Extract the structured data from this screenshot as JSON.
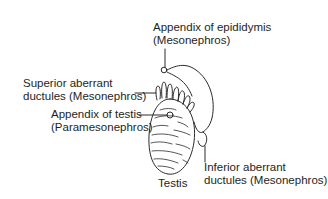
{
  "diagram": {
    "structure": "Testis",
    "labels": {
      "appendix_epididymis": {
        "line1": "Appendix of epididymis",
        "line2": "(Mesonephros)"
      },
      "superior_aberrant": {
        "line1": "Superior aberrant",
        "line2": "ductules (Mesonephros)"
      },
      "appendix_testis": {
        "line1": "Appendix of testis",
        "line2": "(Paramesonephros)"
      },
      "testis": "Testis",
      "inferior_aberrant": {
        "line1": "Inferior aberrant",
        "line2": "ductules (Mesonephros)"
      }
    },
    "colors": {
      "line": "#2a2a2a",
      "background": "#ffffff"
    }
  }
}
